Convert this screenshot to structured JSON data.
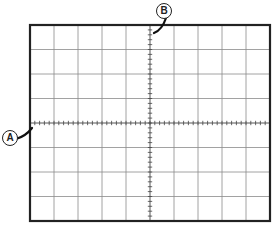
{
  "diagram": {
    "type": "oscilloscope-graticule",
    "grid": {
      "columns": 10,
      "rows": 8,
      "minor_ticks_per_division": 5
    },
    "colors": {
      "frame": "#222222",
      "grid": "#8a8a8a",
      "axis": "#444444",
      "background": "#ffffff"
    },
    "callouts": [
      {
        "id": "A",
        "label": "A",
        "points_to": "horizontal center axis (left end)"
      },
      {
        "id": "B",
        "label": "B",
        "points_to": "vertical center axis (top end)"
      }
    ]
  }
}
